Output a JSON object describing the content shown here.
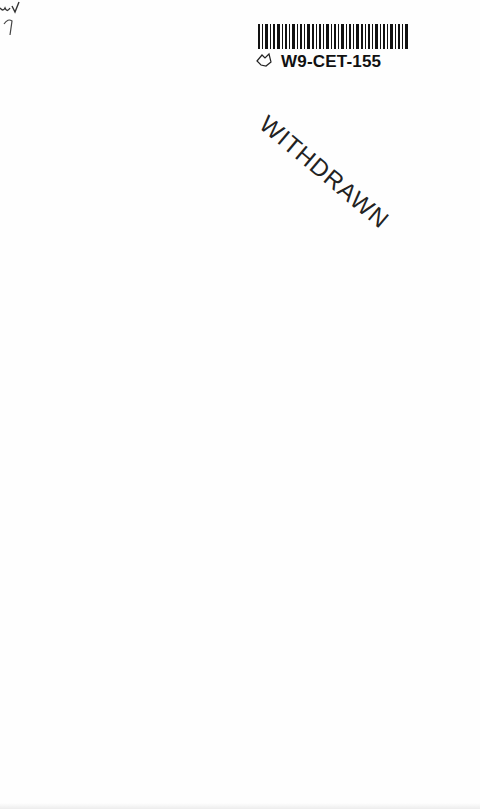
{
  "document": {
    "type": "library book page (scan)",
    "handwritten_marks": [
      "uv",
      "7"
    ],
    "barcode_label": {
      "id": "W9-CET-155"
    },
    "stamp": {
      "text": "WITHDRAWN"
    }
  },
  "colors": {
    "page": "#fefefe",
    "ink": "#111111"
  }
}
